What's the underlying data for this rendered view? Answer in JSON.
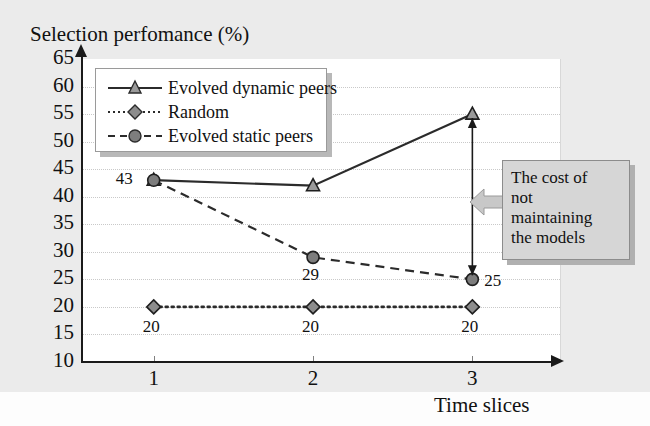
{
  "chart_data": {
    "type": "line",
    "title": "Selection perfomance (%)",
    "xlabel": "Time slices",
    "ylabel": "Selection perfomance (%)",
    "categories": [
      "1",
      "2",
      "3"
    ],
    "x": [
      1,
      2,
      3
    ],
    "xlim": [
      0.55,
      3.55
    ],
    "ylim": [
      10,
      65
    ],
    "ytick_labels": [
      "65",
      "60",
      "55",
      "50",
      "45",
      "40",
      "35",
      "30",
      "25",
      "20",
      "15",
      "10"
    ],
    "yticks": [
      65,
      60,
      55,
      50,
      45,
      40,
      35,
      30,
      25,
      20,
      15,
      10
    ],
    "grid": true,
    "legend_position": "upper-left-inside",
    "series": [
      {
        "name": "Evolved dynamic peers",
        "values": [
          43,
          42,
          55
        ],
        "marker": "triangle",
        "line_style": "solid",
        "color": "#2b2b2b",
        "point_labels": [
          "",
          "",
          ""
        ]
      },
      {
        "name": "Random",
        "values": [
          20,
          20,
          20
        ],
        "marker": "diamond",
        "line_style": "dotted",
        "color": "#2b2b2b",
        "point_labels": [
          "20",
          "20",
          "20"
        ]
      },
      {
        "name": "Evolved static peers",
        "values": [
          43,
          29,
          25
        ],
        "marker": "circle",
        "line_style": "dashed",
        "color": "#2b2b2b",
        "point_labels": [
          "43",
          "29",
          "25"
        ]
      }
    ],
    "annotations": [
      {
        "name": "cost-callout",
        "text": "The cost of not maintaining the models",
        "lines": [
          "The cost of",
          "not",
          "maintaining",
          "the models"
        ],
        "arrow": "double-headed-vertical",
        "arrow_from": 55,
        "arrow_to": 25,
        "arrow_at_x": 3
      }
    ]
  },
  "colors": {
    "plot_background": "#ffffff",
    "figure_background": "#ebebeb",
    "axis": "#1a1a1a",
    "grid": "#c9c9c9",
    "series": "#2b2b2b",
    "callout_fill": "#d6d6d6",
    "callout_border": "#8c8c8c"
  }
}
